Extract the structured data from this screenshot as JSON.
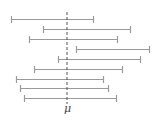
{
  "chart_data": {
    "type": "interval",
    "title": "",
    "reference_line": {
      "label": "μ",
      "x": 67,
      "style": "dashed"
    },
    "intervals": [
      {
        "y": 19,
        "lower": 11,
        "upper": 94
      },
      {
        "y": 29,
        "lower": 43,
        "upper": 131
      },
      {
        "y": 39,
        "lower": 29,
        "upper": 118
      },
      {
        "y": 49,
        "lower": 76,
        "upper": 150
      },
      {
        "y": 59,
        "lower": 58,
        "upper": 141
      },
      {
        "y": 69,
        "lower": 34,
        "upper": 123
      },
      {
        "y": 79,
        "lower": 16,
        "upper": 104
      },
      {
        "y": 88,
        "lower": 20,
        "upper": 109
      },
      {
        "y": 98,
        "lower": 24,
        "upper": 117
      }
    ],
    "grid": false,
    "legend": null
  },
  "labels": {
    "mu": "μ"
  },
  "colors": {
    "interval": "#9a9a9a",
    "reference": "#555555",
    "background": "#ffffff"
  }
}
